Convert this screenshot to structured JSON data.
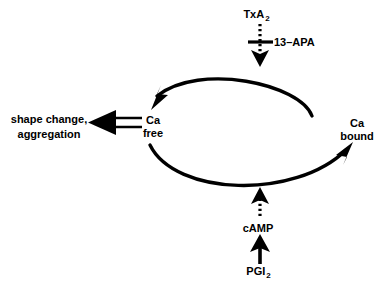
{
  "diagram": {
    "type": "cycle-diagram",
    "background_color": "#ffffff",
    "stroke_color": "#000000",
    "nodes": [
      {
        "id": "ca-free",
        "label_line1": "Ca",
        "label_line2": "free",
        "x": 153,
        "y": 114
      },
      {
        "id": "ca-bound",
        "label_line1": "Ca",
        "label_line2": "bound",
        "x": 357,
        "y": 117
      },
      {
        "id": "shape-change",
        "label_line1": "shape change,",
        "label_line2": "aggregation",
        "x": 49,
        "y": 112
      },
      {
        "id": "txa2",
        "label_base": "TxA",
        "label_sub": "2",
        "x": 256,
        "y": 8
      },
      {
        "id": "inhibitor-13-apa",
        "label_base": "13–APA",
        "label_sub": "",
        "x": 274,
        "y": 36
      },
      {
        "id": "camp",
        "label_base": "cAMP",
        "label_sub": "",
        "x": 258,
        "y": 222
      },
      {
        "id": "pgi2",
        "label_base": "PGI",
        "label_sub": "2",
        "x": 258,
        "y": 265
      }
    ],
    "edges": [
      {
        "id": "bound-to-free",
        "from": "ca-bound",
        "to": "ca-free",
        "style": "solid-curve",
        "arrow": "single"
      },
      {
        "id": "free-to-bound",
        "from": "ca-free",
        "to": "ca-bound",
        "style": "solid-curve",
        "arrow": "single"
      },
      {
        "id": "free-to-shape-change",
        "from": "ca-free",
        "to": "shape-change",
        "style": "open-double-line",
        "arrow": "single"
      },
      {
        "id": "txa2-to-cycle",
        "from": "txa2",
        "to": "bound-to-free",
        "style": "dotted",
        "arrow": "single"
      },
      {
        "id": "apa-inhibition",
        "from": "inhibitor-13-apa",
        "to": "txa2-to-cycle",
        "style": "crossbar",
        "arrow": "none"
      },
      {
        "id": "camp-to-cycle",
        "from": "camp",
        "to": "free-to-bound",
        "style": "dotted",
        "arrow": "single"
      },
      {
        "id": "pgi2-to-camp",
        "from": "pgi2",
        "to": "camp",
        "style": "solid",
        "arrow": "single"
      }
    ]
  }
}
